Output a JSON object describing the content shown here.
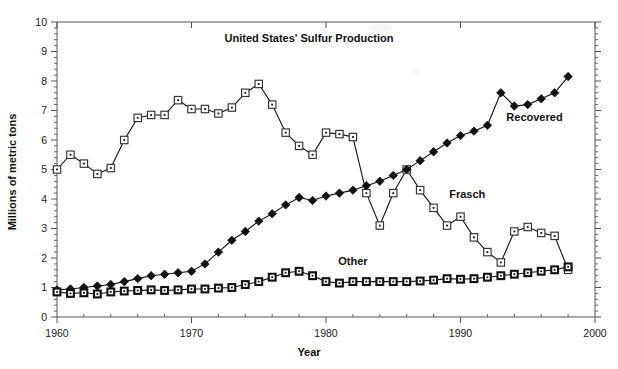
{
  "chart_data": {
    "type": "line",
    "title": "United States' Sulfur Production",
    "xlabel": "Year",
    "ylabel": "Millions of metric tons",
    "xlim": [
      1960,
      2000
    ],
    "ylim": [
      0,
      10
    ],
    "xticks": [
      1960,
      1970,
      1980,
      1990,
      2000
    ],
    "yticks": [
      0,
      1,
      2,
      3,
      4,
      5,
      6,
      7,
      8,
      9,
      10
    ],
    "xtick_labels": [
      "1960",
      "1970",
      "1980",
      "1990",
      "2000"
    ],
    "ytick_labels": [
      "0",
      "1",
      "2",
      "3",
      "4",
      "5",
      "6",
      "7",
      "8",
      "9",
      "10"
    ],
    "minor_ticks": true,
    "grid": false,
    "legend": "inline-annotations",
    "x": [
      1960,
      1961,
      1962,
      1963,
      1964,
      1965,
      1966,
      1967,
      1968,
      1969,
      1970,
      1971,
      1972,
      1973,
      1974,
      1975,
      1976,
      1977,
      1978,
      1979,
      1980,
      1981,
      1982,
      1983,
      1984,
      1985,
      1986,
      1987,
      1988,
      1989,
      1990,
      1991,
      1992,
      1993,
      1994,
      1995,
      1996,
      1997,
      1998
    ],
    "series": [
      {
        "name": "Frasch",
        "marker": "open-square",
        "label_x": 1990.5,
        "label_y": 4.05,
        "values": [
          5.0,
          5.5,
          5.2,
          4.85,
          5.05,
          6.0,
          6.75,
          6.85,
          6.85,
          7.35,
          7.05,
          7.05,
          6.9,
          7.1,
          7.6,
          7.9,
          7.2,
          6.25,
          5.8,
          5.5,
          6.25,
          6.2,
          6.1,
          4.2,
          3.1,
          4.2,
          5.0,
          4.3,
          3.7,
          3.1,
          3.4,
          2.7,
          2.2,
          1.85,
          2.9,
          3.05,
          2.85,
          2.75,
          1.6
        ]
      },
      {
        "name": "Recovered",
        "marker": "filled-diamond",
        "label_x": 1995.5,
        "label_y": 6.65,
        "values": [
          0.92,
          0.95,
          1.0,
          1.05,
          1.1,
          1.2,
          1.3,
          1.4,
          1.45,
          1.5,
          1.55,
          1.8,
          2.2,
          2.6,
          2.9,
          3.25,
          3.5,
          3.8,
          4.05,
          3.95,
          4.1,
          4.2,
          4.3,
          4.45,
          4.6,
          4.8,
          5.0,
          5.3,
          5.6,
          5.9,
          6.15,
          6.3,
          6.5,
          7.6,
          7.15,
          7.2,
          7.4,
          7.6,
          8.15
        ]
      },
      {
        "name": "Other",
        "marker": "bold-square",
        "label_x": 1982.0,
        "label_y": 1.75,
        "values": [
          0.85,
          0.8,
          0.82,
          0.78,
          0.85,
          0.88,
          0.9,
          0.92,
          0.9,
          0.92,
          0.95,
          0.95,
          0.98,
          1.0,
          1.1,
          1.2,
          1.35,
          1.5,
          1.55,
          1.4,
          1.2,
          1.15,
          1.2,
          1.2,
          1.2,
          1.2,
          1.2,
          1.22,
          1.25,
          1.3,
          1.28,
          1.3,
          1.35,
          1.4,
          1.45,
          1.5,
          1.55,
          1.6,
          1.7
        ]
      }
    ]
  },
  "colors": {
    "axis": "#555555",
    "line": "#111111",
    "marker_fill_open": "#ffffff",
    "marker_fill_solid": "#111111",
    "background": "#ffffff"
  }
}
